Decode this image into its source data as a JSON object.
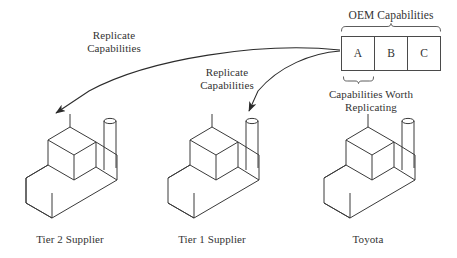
{
  "diagram": {
    "title_text": "OEM Capabilities",
    "background_color": "#ffffff",
    "stroke_color": "#3a3a3a",
    "text_color": "#333333"
  },
  "oem_box": {
    "bracket_label": "OEM Capabilities",
    "cells": [
      {
        "label": "A"
      },
      {
        "label": "B"
      },
      {
        "label": "C"
      }
    ],
    "sub_bracket_label": "Capabilities Worth\nReplicating",
    "sub_bracket_line1": "Capabilities Worth",
    "sub_bracket_line2": "Replicating"
  },
  "arrows": [
    {
      "name": "arrow-to-tier2",
      "label_line1": "Replicate",
      "label_line2": "Capabilities",
      "label": "Replicate\nCapabilities"
    },
    {
      "name": "arrow-to-tier1",
      "label_line1": "Replicate",
      "label_line2": "Capabilities",
      "label": "Replicate\nCapabilities"
    }
  ],
  "factories": [
    {
      "name": "tier-2-supplier",
      "label": "Tier 2 Supplier"
    },
    {
      "name": "tier-1-supplier",
      "label": "Tier 1 Supplier"
    },
    {
      "name": "toyota",
      "label": "Toyota"
    }
  ]
}
